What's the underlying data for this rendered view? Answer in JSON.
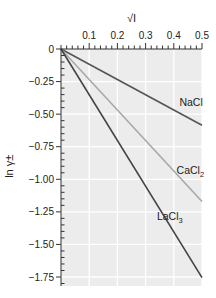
{
  "chart_data": {
    "type": "line",
    "title": "",
    "xlabel": "√I",
    "ylabel": "ln γ±",
    "x_axis_position": "top",
    "xlim": [
      0,
      0.5
    ],
    "ylim": [
      -1.8,
      0
    ],
    "x_ticks": [
      0.1,
      0.2,
      0.3,
      0.4,
      0.5
    ],
    "x_tick_labels": [
      "0.1",
      "0.2",
      "0.3",
      "0.4",
      "0.5"
    ],
    "y_ticks": [
      0,
      -0.25,
      -0.5,
      -0.75,
      -1.0,
      -1.25,
      -1.5,
      -1.75
    ],
    "y_tick_labels": [
      "0",
      "−0.25",
      "−0.50",
      "−0.75",
      "−1.00",
      "−1.25",
      "−1.50",
      "−1.75"
    ],
    "grid": true,
    "series": [
      {
        "name": "NaCl",
        "label_main": "NaCl",
        "label_sub": "",
        "color": "#555555",
        "x": [
          0,
          0.5
        ],
        "y": [
          0,
          -0.585
        ]
      },
      {
        "name": "CaCl2",
        "label_main": "CaCl",
        "label_sub": "2",
        "color": "#a8a8a8",
        "x": [
          0,
          0.5
        ],
        "y": [
          0,
          -1.17
        ]
      },
      {
        "name": "LaCl3",
        "label_main": "LaCl",
        "label_sub": "3",
        "color": "#444444",
        "x": [
          0,
          0.5
        ],
        "y": [
          0,
          -1.755
        ]
      }
    ],
    "annotations": [
      {
        "series": "NaCl",
        "x": 0.42,
        "y": -0.44
      },
      {
        "series": "CaCl2",
        "x": 0.41,
        "y": -0.96
      },
      {
        "series": "LaCl3",
        "x": 0.34,
        "y": -1.31
      }
    ]
  }
}
